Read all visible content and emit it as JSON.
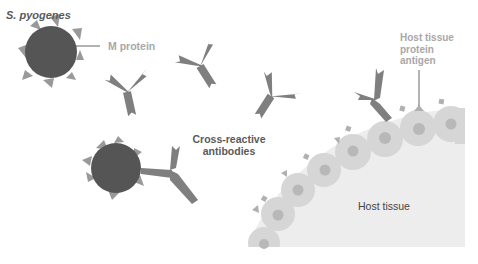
{
  "labels": {
    "species": "S. pyogenes",
    "m_protein": "M protein",
    "host_antigen": "Host tissue protein antigen",
    "cross_reactive": "Cross-reactive antibodies",
    "host_tissue": "Host tissue"
  },
  "colors": {
    "bacterium": "#555555",
    "m_protein_spikes": "#999999",
    "antibody": "#7f7f7f",
    "tissue_fill": "#ededed",
    "cell_fill": "#d6d6d6",
    "nucleus": "#b8b8b8",
    "antigen": "#b0b0b0",
    "label_dark": "#5a5a5a",
    "label_light": "#a8a8a8",
    "leader_line": "#555555"
  },
  "elements": {
    "bacteria_count": 2,
    "free_antibodies_count": 4,
    "bound_antibodies_count": 2
  }
}
